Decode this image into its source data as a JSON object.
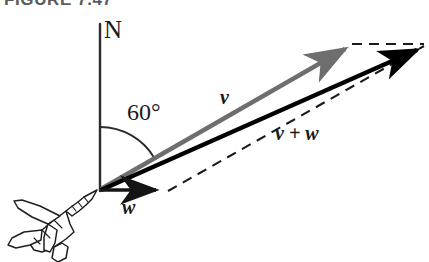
{
  "figure": {
    "caption": "FIGURE 7.47",
    "background_color": "#ffffff"
  },
  "labels": {
    "north_axis": "N",
    "angle": "60°",
    "vector_v": "v",
    "vector_w": "w",
    "resultant": "v + w",
    "resultant_plus": "+"
  },
  "colors": {
    "vector_v": "#6e6e6e",
    "vector_w": "#141414",
    "resultant": "#000000",
    "axis": "#2b2b2b",
    "arc": "#2b2b2b",
    "dashed": "#1a1a1a",
    "airplane_stroke": "#1f1f1f",
    "airplane_fill": "#ffffff",
    "caption_text": "#5b5b5b",
    "label_text": "#1a1a1a"
  },
  "geometry": {
    "origin": {
      "x": 100,
      "y": 190
    },
    "north_axis_top": {
      "x": 100,
      "y": 24
    },
    "vector_v_tip": {
      "x": 352,
      "y": 43
    },
    "vector_w_tip": {
      "x": 166,
      "y": 190
    },
    "resultant_tip": {
      "x": 424,
      "y": 44
    },
    "angle_degrees": 60,
    "arc_radius": 63
  },
  "elements": {
    "airplane_name": "jet-airplane-illustration",
    "north_axis_name": "north-reference-axis",
    "angle_arc_name": "angle-arc",
    "dashed_upper_name": "dashed-construction-line-upper",
    "dashed_lower_name": "dashed-construction-line-lower"
  }
}
